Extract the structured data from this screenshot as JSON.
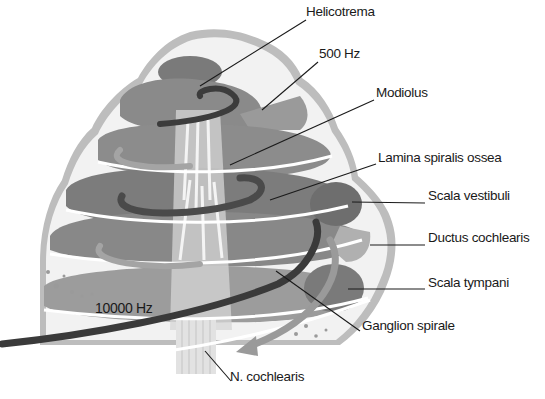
{
  "diagram": {
    "colors": {
      "bone": "#f2f2f2",
      "outer_shell": "#bdbdbd",
      "scala_dark": "#6e6e6e",
      "scala_mid": "#8c8c8c",
      "scala_light": "#a8a8a8",
      "arrow_dark": "#3c3c3c",
      "arrow_light": "#9a9a9a",
      "leader_line": "#1a1a1a",
      "text": "#1a1a1a"
    },
    "labels": [
      {
        "id": "helicotrema",
        "text": "Helicotrema",
        "x": 306,
        "y": 12,
        "line": [
          306,
          20,
          200,
          86
        ]
      },
      {
        "id": "500hz",
        "text": "500 Hz",
        "x": 319,
        "y": 54,
        "line": [
          318,
          62,
          262,
          110
        ]
      },
      {
        "id": "modiolus",
        "text": "Modiolus",
        "x": 376,
        "y": 93,
        "line": [
          374,
          100,
          230,
          165
        ]
      },
      {
        "id": "lamina-spiralis-ossea",
        "text": "Lamina spiralis ossea",
        "x": 378,
        "y": 158,
        "line": [
          376,
          164,
          270,
          200
        ]
      },
      {
        "id": "scala-vestibuli",
        "text": "Scala vestibuli",
        "x": 428,
        "y": 196,
        "line": [
          425,
          203,
          352,
          202
        ]
      },
      {
        "id": "ductus-cochlearis",
        "text": "Ductus cochlearis",
        "x": 428,
        "y": 238,
        "line": [
          425,
          245,
          370,
          245
        ]
      },
      {
        "id": "scala-tympani",
        "text": "Scala tympani",
        "x": 428,
        "y": 283,
        "line": [
          425,
          289,
          348,
          289
        ]
      },
      {
        "id": "ganglion-spirale",
        "text": "Ganglion spirale",
        "x": 362,
        "y": 326,
        "line": [
          360,
          331,
          276,
          271
        ]
      },
      {
        "id": "n-cochlearis",
        "text": "N. cochlearis",
        "x": 230,
        "y": 377,
        "line": [
          231,
          381,
          205,
          351
        ]
      }
    ],
    "frequency_labels": [
      {
        "id": "10000hz",
        "text": "10000 Hz",
        "x": 95,
        "y": 308
      }
    ]
  }
}
